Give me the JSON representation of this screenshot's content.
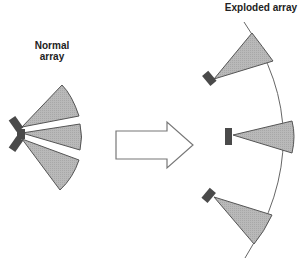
{
  "labels": {
    "normal_line1": "Normal",
    "normal_line2": "array",
    "exploded": "Exploded array"
  },
  "colors": {
    "beam_fill": "#b4b4b4",
    "beam_stroke": "#555555",
    "speaker_fill": "#4a4a4a",
    "arc_stroke": "#666666",
    "arrow_stroke": "#777777"
  },
  "diagram": {
    "left": {
      "name": "normal-array",
      "speakers": 3,
      "arrangement": "clustered, fanned beams"
    },
    "transition": {
      "name": "arrow",
      "direction": "right"
    },
    "right": {
      "name": "exploded-array",
      "speakers": 3,
      "arrangement": "spread along arc"
    }
  }
}
